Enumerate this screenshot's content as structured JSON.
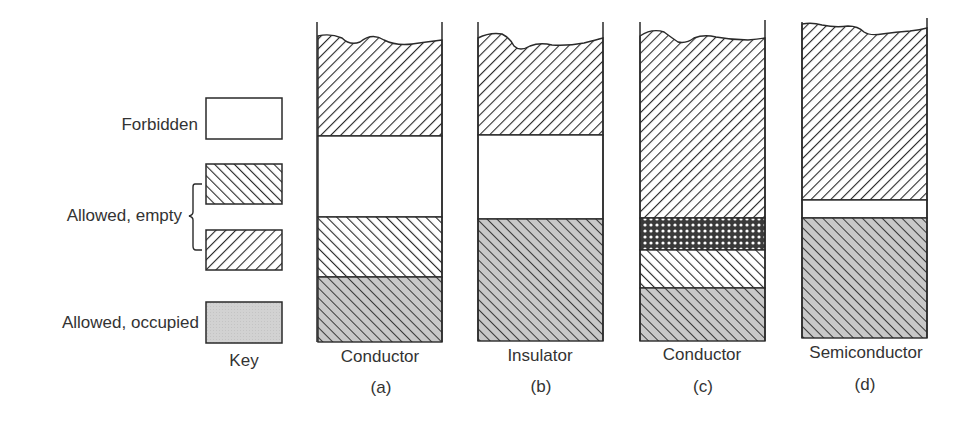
{
  "key": {
    "title": "Key",
    "items": [
      {
        "label": "Forbidden",
        "fill": "forbidden"
      },
      {
        "label": "Allowed, empty",
        "fill": "empty-right",
        "fill2": "empty-left"
      },
      {
        "label": "Allowed, occupied",
        "fill": "occupied"
      }
    ]
  },
  "columns": [
    {
      "name": "Conductor",
      "letter": "(a)",
      "bands": [
        {
          "type": "empty-left",
          "label": "Allowed, empty"
        },
        {
          "type": "forbidden",
          "label": "Forbidden"
        },
        {
          "type": "empty-right",
          "label": "Allowed, empty"
        },
        {
          "type": "occupied-hatch",
          "label": "Allowed, occupied"
        }
      ]
    },
    {
      "name": "Insulator",
      "letter": "(b)",
      "bands": [
        {
          "type": "empty-left",
          "label": "Allowed, empty"
        },
        {
          "type": "forbidden",
          "label": "Forbidden"
        },
        {
          "type": "occupied-hatch",
          "label": "Allowed, occupied"
        }
      ]
    },
    {
      "name": "Conductor",
      "letter": "(c)",
      "bands": [
        {
          "type": "empty-left",
          "label": "Allowed, empty"
        },
        {
          "type": "overlap-crosshatch",
          "label": "Overlap"
        },
        {
          "type": "empty-right",
          "label": "Allowed, empty"
        },
        {
          "type": "occupied-hatch",
          "label": "Allowed, occupied"
        }
      ]
    },
    {
      "name": "Semiconductor",
      "letter": "(d)",
      "bands": [
        {
          "type": "empty-left",
          "label": "Allowed, empty"
        },
        {
          "type": "forbidden",
          "label": "Forbidden (narrow gap)"
        },
        {
          "type": "occupied-hatch",
          "label": "Allowed, occupied"
        }
      ]
    }
  ],
  "colors": {
    "line": "#2a2a2a",
    "occupied": "#cfcfcf",
    "forbidden": "#ffffff"
  }
}
